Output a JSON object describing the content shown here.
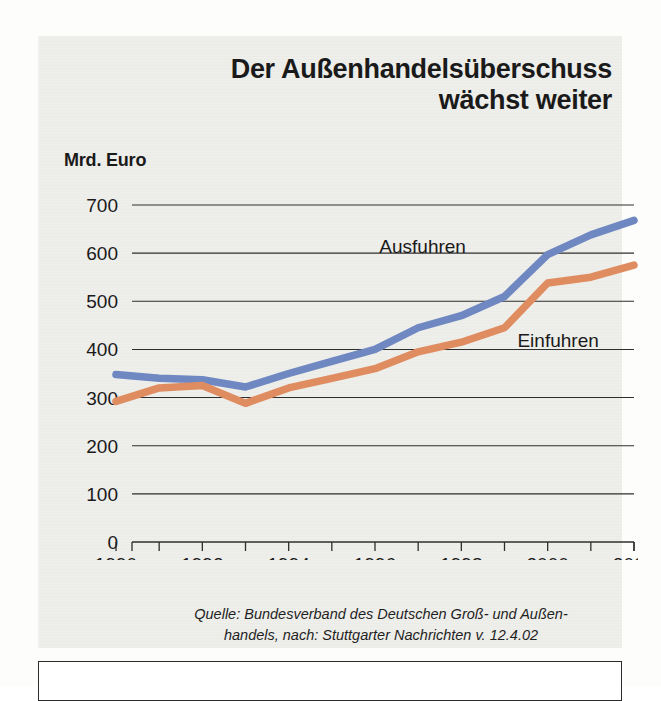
{
  "headline": {
    "line1": "Der Außenhandelsüberschuss",
    "line2": "wächst weiter"
  },
  "unit_label": "Mrd. Euro",
  "source": {
    "line1": "Quelle: Bundesverband des Deutschen Groß- und Außen-",
    "line2": "handels, nach: Stuttgarter Nachrichten v. 12.4.02"
  },
  "colors": {
    "exports": "#6f88c2",
    "imports": "#e08c61",
    "axis": "#2e2e2e",
    "panel": "#eeeeea",
    "text": "#1a1a1a"
  },
  "chart_data": {
    "type": "line",
    "title": "Der Außenhandelsüberschuss wächst weiter",
    "xlabel": "",
    "ylabel": "Mrd. Euro",
    "ylim": [
      0,
      700
    ],
    "xlim": [
      1990,
      2002
    ],
    "grid": true,
    "legend_position": "inline-right",
    "ytick_labels": [
      "0",
      "100",
      "200",
      "300",
      "400",
      "500",
      "600",
      "700"
    ],
    "ytick_values": [
      0,
      100,
      200,
      300,
      400,
      500,
      600,
      700
    ],
    "xtick_labels": [
      "1990",
      "1992",
      "1994",
      "1996",
      "1998",
      "2000",
      "2002"
    ],
    "xtick_values": [
      1990,
      1992,
      1994,
      1996,
      1998,
      2000,
      2002
    ],
    "x": [
      1990,
      1991,
      1992,
      1993,
      1994,
      1995,
      1996,
      1997,
      1998,
      1999,
      2000,
      2001,
      2002
    ],
    "series": [
      {
        "name": "Ausfuhren",
        "color": "#6f88c2",
        "values": [
          348,
          340,
          337,
          322,
          350,
          375,
          400,
          445,
          470,
          510,
          597,
          638,
          668
        ]
      },
      {
        "name": "Einfuhren",
        "color": "#e08c61",
        "values": [
          292,
          320,
          325,
          288,
          320,
          340,
          360,
          395,
          415,
          445,
          538,
          550,
          575
        ]
      }
    ],
    "annotations": [
      {
        "text": "Ausfuhren",
        "x": 1996.1,
        "y": 600
      },
      {
        "text": "Einfuhren",
        "x": 1999.3,
        "y": 405
      }
    ]
  }
}
